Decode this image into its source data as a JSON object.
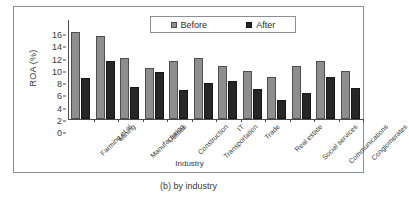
{
  "caption": "(b) by industry",
  "legend": {
    "before_label": "Before",
    "after_label": "After",
    "before_color": "#8e8e8e",
    "after_color": "#262626"
  },
  "axes": {
    "y_title": "ROA (%)",
    "x_title": "Industry",
    "y_ticks": [
      "0",
      "2",
      "4",
      "6",
      "8",
      "10",
      "12",
      "14",
      "16"
    ]
  },
  "chart_data": {
    "type": "bar",
    "title": "(b) by industry",
    "xlabel": "Industry",
    "ylabel": "ROA (%)",
    "ylim": [
      0,
      16
    ],
    "ytick_step": 2,
    "grid": false,
    "legend_position": "top-center",
    "categories": [
      "Farming et al",
      "Mining",
      "Manufacturing",
      "Utilities",
      "Construction",
      "Transportation",
      "IT",
      "Trade",
      "Real estate",
      "Social services",
      "Communications",
      "Conglomerates"
    ],
    "series": [
      {
        "name": "Before",
        "color": "#8e8e8e",
        "values": [
          14.2,
          13.6,
          9.9,
          8.4,
          9.5,
          9.9,
          8.7,
          7.8,
          6.9,
          8.6,
          9.4,
          7.8
        ]
      },
      {
        "name": "After",
        "color": "#262626",
        "values": [
          6.7,
          9.4,
          5.3,
          7.6,
          4.8,
          5.8,
          6.2,
          4.9,
          3.1,
          4.3,
          6.9,
          5.0
        ]
      }
    ]
  }
}
